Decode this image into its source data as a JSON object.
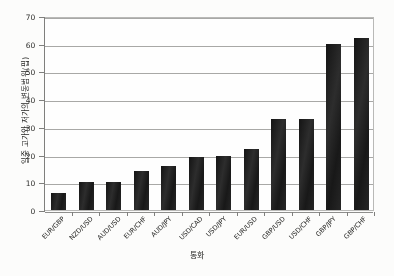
{
  "chart_data": {
    "type": "bar",
    "title": "",
    "xlabel": "통화",
    "ylabel": "일중 고가와 저가의 변동범위(핍)",
    "categories": [
      "EUR/GBP",
      "NZD/USD",
      "AUD/USD",
      "EUR/CHF",
      "AUD/JPY",
      "USD/CAD",
      "USD/JPY",
      "EUR/USD",
      "GBP/USD",
      "USD/CHF",
      "GBP/JPY",
      "GBP/CHF"
    ],
    "values": [
      6,
      10,
      10,
      14,
      16,
      19,
      19.5,
      22,
      33,
      33,
      60,
      62
    ],
    "ylim": [
      0,
      70
    ],
    "yticks": [
      0,
      10,
      20,
      30,
      40,
      50,
      60,
      70
    ],
    "ytick_labels": [
      "0",
      "10",
      "20",
      "30",
      "40",
      "50",
      "60",
      "70"
    ],
    "grid": true,
    "legend": false,
    "legend_position": "none",
    "bar_color": "#191919",
    "gridline_color": "#a8a8a6",
    "axis_color": "#7e7e7c",
    "background_color": "#ffffff"
  }
}
